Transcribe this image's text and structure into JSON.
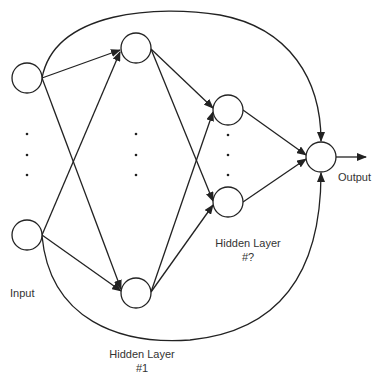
{
  "labels": {
    "input": "Input",
    "output": "Output",
    "hidden_last_title": "Hidden Layer",
    "hidden_last_num": "#?",
    "hidden_first_title": "Hidden Layer",
    "hidden_first_num": "#1"
  },
  "colors": {
    "stroke": "#222222",
    "text": "#333333"
  }
}
